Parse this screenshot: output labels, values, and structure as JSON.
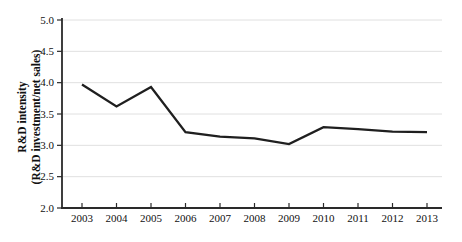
{
  "colors": {
    "background": "#ffffff",
    "line": "#1f1f1f",
    "grid": "#e0e0e0",
    "axis": "#2a2a2a",
    "text": "#111111"
  },
  "chart_data": {
    "type": "line",
    "title": "",
    "x": [
      "2003",
      "2004",
      "2005",
      "2006",
      "2007",
      "2008",
      "2009",
      "2010",
      "2011",
      "2012",
      "2013"
    ],
    "values": [
      3.97,
      3.62,
      3.93,
      3.21,
      3.14,
      3.11,
      3.02,
      3.29,
      3.26,
      3.22,
      3.21
    ],
    "ylabel_line1": "R&D intensity",
    "ylabel_line2": "(R&D investment/net sales)",
    "xlabel": "",
    "ylim": [
      2.0,
      5.0
    ],
    "yticks": [
      "5.0",
      "4.5",
      "4.0",
      "3.5",
      "3.0",
      "2.5",
      "2.0"
    ],
    "grid": true,
    "legend": false
  }
}
